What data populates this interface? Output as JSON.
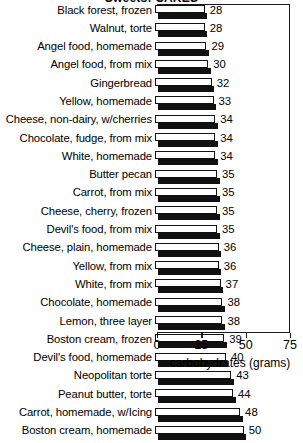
{
  "chart_data": {
    "type": "bar",
    "orientation": "horizontal",
    "title": "Sweets: CAKES",
    "xlabel": "carbohydrates (grams)",
    "ylabel": "",
    "xlim": [
      0,
      75
    ],
    "xticks": [
      0,
      25,
      50,
      75
    ],
    "xtick_labels": [
      "0",
      "25",
      "50",
      "75"
    ],
    "grid": false,
    "legend": false,
    "categories": [
      "Black forest, frozen",
      "Walnut, torte",
      "Angel food, homemade",
      "Angel food, from mix",
      "Gingerbread",
      "Yellow, homemade",
      "Cheese, non-dairy, w/cherries",
      "Chocolate, fudge, from mix",
      "White, homemade",
      "Butter pecan",
      "Carrot, from mix",
      "Cheese, cherry, frozen",
      "Devil's food, from mix",
      "Cheese, plain, homemade",
      "Yellow, from mix",
      "White, from mix",
      "Chocolate, homemade",
      "Lemon, three layer",
      "Boston cream, frozen",
      "Devil's food, homemade",
      "Neopolitan torte",
      "Peanut butter, torte",
      "Carrot, homemade, w/Icing",
      "Boston cream, homemade"
    ],
    "values": [
      28,
      28,
      29,
      30,
      32,
      33,
      34,
      34,
      34,
      35,
      35,
      35,
      35,
      36,
      36,
      37,
      38,
      38,
      39,
      40,
      43,
      44,
      48,
      50
    ],
    "value_labels": [
      "28",
      "28",
      "29",
      "30",
      "32",
      "33",
      "34",
      "34",
      "34",
      "35",
      "35",
      "35",
      "35",
      "36",
      "36",
      "37",
      "38",
      "38",
      "39",
      "40",
      "43",
      "44",
      "48",
      "50"
    ],
    "colors": {
      "bar_face": "#ffffff",
      "bar_edge": "#111111",
      "bar_shadow": "#111111",
      "axis": "#1a1a1a",
      "text": "#000000",
      "background": "#ffffff"
    }
  }
}
